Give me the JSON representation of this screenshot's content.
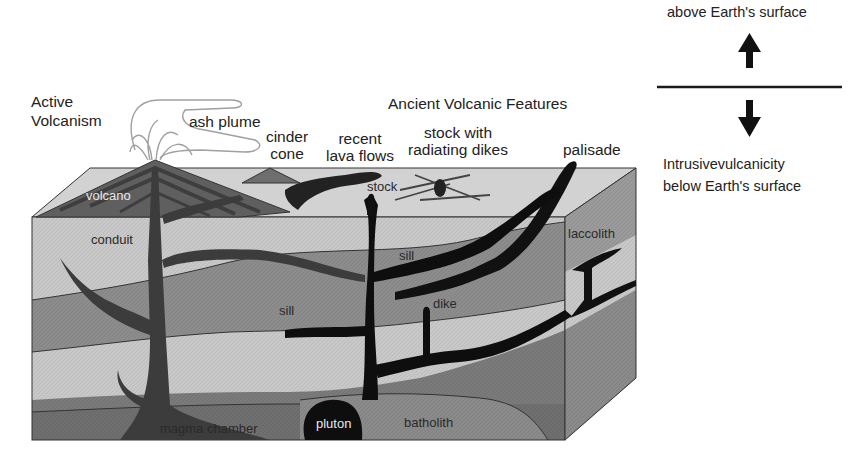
{
  "diagram": {
    "title_active": "Active\nVolcanism",
    "title_active_lines": [
      "Active",
      "Volcanism"
    ],
    "title_ancient": "Ancient Volcanic Features",
    "surface_labels": {
      "ash_plume": "ash plume",
      "cinder_cone": [
        "cinder",
        "cone"
      ],
      "recent_lava_flows": [
        "recent",
        "lava flows"
      ],
      "stock_with_radiating_dikes": [
        "stock with",
        "radiating dikes"
      ],
      "palisade": "palisade"
    },
    "block_labels": {
      "volcano": "volcano",
      "stock": "stock",
      "conduit": "conduit",
      "sill_upper": "sill",
      "sill_lower": "sill",
      "dike": "dike",
      "laccolith": "laccolith",
      "magma_chamber": "magma chamber",
      "pluton": "pluton",
      "batholith": "batholith"
    },
    "colors": {
      "magma": "#111111",
      "layer_light": "#c9c9c9",
      "layer_mid": "#8e8e8e",
      "layer_dark": "#6f6f6f",
      "surface_top": "#d4d4d4",
      "volcano_dark": "#5a5a5a",
      "side_face": "#9a9a9a",
      "plume_outline": "#9c9c9c"
    }
  },
  "legend": {
    "above_label": "above Earth's surface",
    "below_label_line1": "Intrusivevulcanicity",
    "below_label_line2": "below Earth's surface",
    "up_arrow_icon": "arrow-up",
    "down_arrow_icon": "arrow-down"
  }
}
